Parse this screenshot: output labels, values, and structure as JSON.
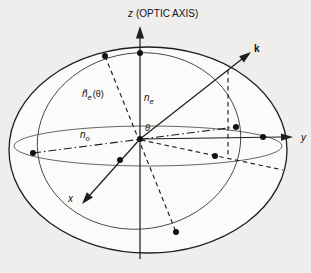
{
  "labels": {
    "z_axis": {
      "var": "z",
      "rest": "(OPTIC AXIS)"
    },
    "k_vector": "k",
    "y_axis": "y",
    "x_axis": "x",
    "n_o": {
      "base": "n",
      "sub": "o"
    },
    "n_e": {
      "base": "n",
      "sub": "e"
    },
    "n_e_theta": {
      "base": "ñ",
      "sub": "e",
      "arg": "(θ)"
    },
    "theta": "θ"
  },
  "colors": {
    "background": "#f0eeec",
    "ellipsoid_interior": "#fbfbf9",
    "index_ellipse_fill": "#c9c8c4",
    "line": "#1f1f1f"
  }
}
